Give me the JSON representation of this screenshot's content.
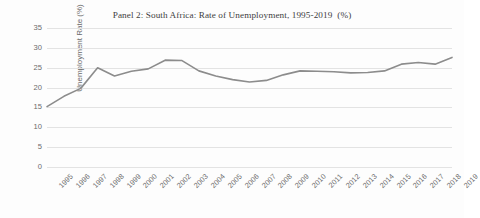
{
  "chart_data": {
    "type": "line",
    "title": "Panel 2: South Africa: Rate of Unemployment, 1995-2019  (%)",
    "xlabel": "",
    "ylabel": "Unemployment Rate (%)",
    "ylim": [
      0,
      35
    ],
    "ytick_step": 5,
    "yticks": [
      35,
      30,
      25,
      20,
      15,
      10,
      5,
      0
    ],
    "grid": true,
    "legend": "none",
    "line_color": "#8c8c8c",
    "grid_color": "#e3e3e3",
    "categories": [
      "1995",
      "1996",
      "1997",
      "1998",
      "1999",
      "2000",
      "2001",
      "2002",
      "2003",
      "2004",
      "2005",
      "2006",
      "2007",
      "2008",
      "2009",
      "2010",
      "2011",
      "2012",
      "2013",
      "2014",
      "2015",
      "2016",
      "2017",
      "2018",
      "2019"
    ],
    "x": [
      1995,
      1996,
      1997,
      1998,
      1999,
      2000,
      2001,
      2002,
      2003,
      2004,
      2005,
      2006,
      2007,
      2008,
      2009,
      2010,
      2011,
      2012,
      2013,
      2014,
      2015,
      2016,
      2017,
      2018,
      2019
    ],
    "series": [
      {
        "name": "Unemployment Rate (%)",
        "values": [
          15.2,
          17.8,
          19.8,
          25.0,
          22.9,
          24.1,
          24.7,
          26.9,
          26.8,
          24.2,
          22.9,
          22.0,
          21.4,
          21.8,
          23.2,
          24.2,
          24.1,
          24.0,
          23.7,
          23.8,
          24.2,
          25.9,
          26.3,
          25.9,
          27.6
        ]
      }
    ]
  }
}
